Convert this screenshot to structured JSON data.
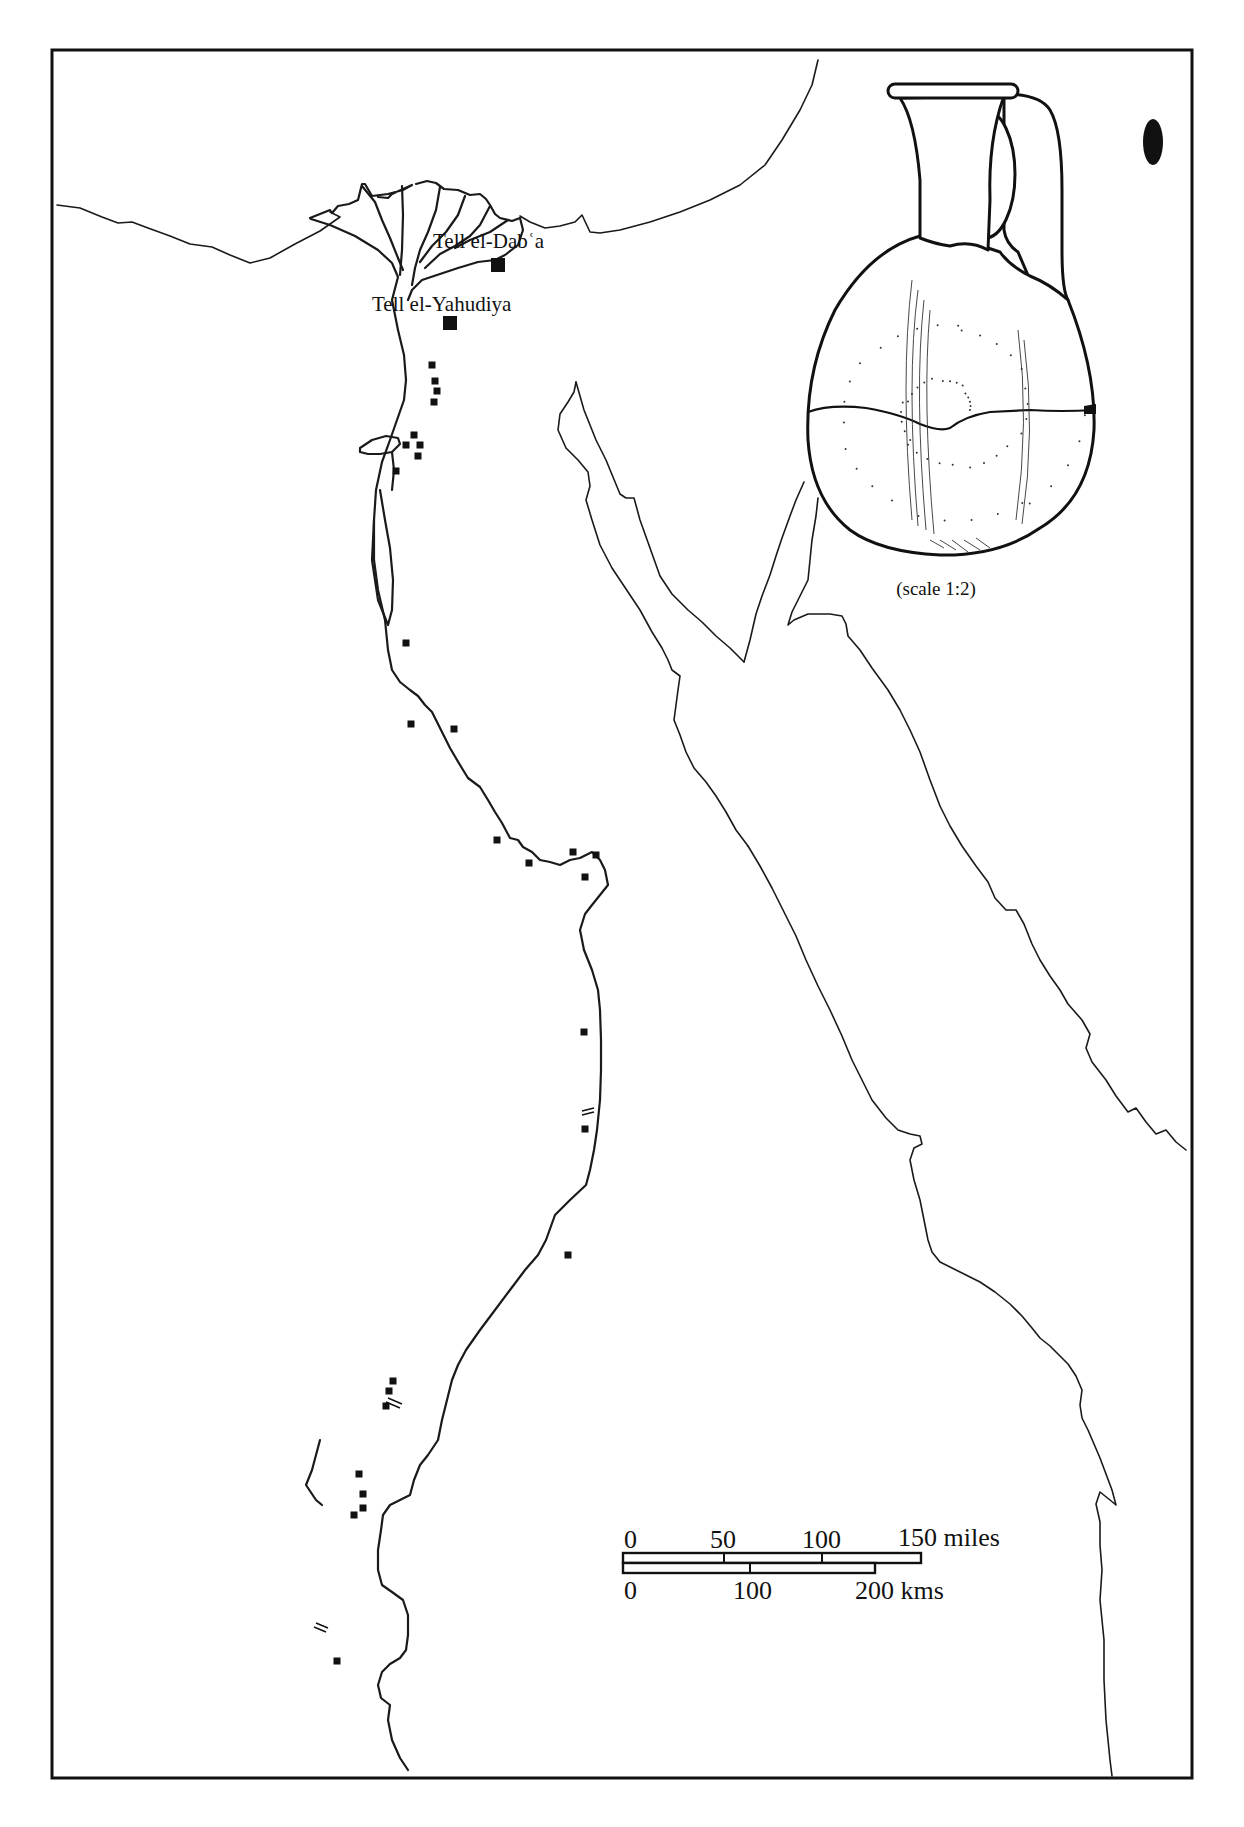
{
  "page": {
    "header_fragment": "Egypt"
  },
  "map": {
    "title": "Distribution map of Tell el-Yahudiya ware sites along the Nile",
    "labels": {
      "tell_el_daba": "Tell el-Dabʿa",
      "tell_el_yahudiya": "Tell el-Yahudiya"
    },
    "major_sites": [
      {
        "name": "Tell el-Dabʿa",
        "symbol": "large-square"
      },
      {
        "name": "Tell el-Yahudiya",
        "symbol": "large-square"
      }
    ],
    "minor_site_count": 33,
    "minor_site_symbol": "small-square",
    "cataract_symbol": "double-tick",
    "cataract_count": 4
  },
  "jug": {
    "caption": "(scale 1:2)",
    "profile_symbol": "black-oval-section"
  },
  "scale_bar": {
    "miles": {
      "ticks": [
        "0",
        "50",
        "100"
      ],
      "end_label": "150 miles",
      "max": 150
    },
    "kms": {
      "ticks": [
        "0",
        "100"
      ],
      "end_label": "200 kms",
      "max": 200
    }
  },
  "colors": {
    "ink": "#111111",
    "paper": "#ffffff"
  }
}
